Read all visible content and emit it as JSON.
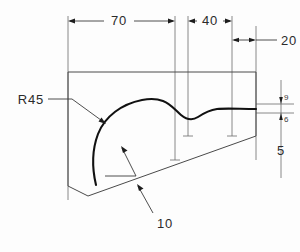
{
  "drawing": {
    "type": "engineering-part-outline-2d",
    "background_color": "#fdfdfd",
    "line_color": "#3a3a3a",
    "profile_color": "#111111",
    "text_color": "#2b2b2b",
    "dimensions": {
      "width_70": "70",
      "width_40": "40",
      "width_20": "20",
      "height_5": "5",
      "height_upper_small": "9",
      "height_lower_small": "6",
      "radius_label": "R45",
      "thickness_label": "10"
    },
    "annotations": [
      {
        "id": "dim-70",
        "label": "70",
        "kind": "linear-horizontal"
      },
      {
        "id": "dim-40",
        "label": "40",
        "kind": "linear-horizontal"
      },
      {
        "id": "dim-20",
        "label": "20",
        "kind": "linear-horizontal"
      },
      {
        "id": "dim-9",
        "label": "9",
        "kind": "linear-vertical"
      },
      {
        "id": "dim-6",
        "label": "6",
        "kind": "linear-vertical"
      },
      {
        "id": "dim-5",
        "label": "5",
        "kind": "linear-vertical"
      },
      {
        "id": "leader-r45",
        "label": "R45",
        "kind": "radius-leader"
      },
      {
        "id": "leader-10",
        "label": "10",
        "kind": "leader"
      }
    ]
  }
}
